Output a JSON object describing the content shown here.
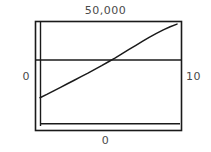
{
  "figure": {
    "title": "50,000",
    "left_label": "0",
    "right_label": "10",
    "bottom_label": "0"
  },
  "colors": {
    "frame": "#1a1a1a",
    "line": "#1a1a1a",
    "reference_line": "#1a1a1a",
    "text": "#4a4a4a",
    "background": "#ffffff"
  },
  "chart_data": {
    "type": "line",
    "title": "50,000",
    "xlabel": "0",
    "ylabel": "",
    "left_axis_label": "0",
    "right_axis_label": "10",
    "bottom_axis_label": "0",
    "grid": false,
    "legend": "none",
    "xlim": [
      0,
      10
    ],
    "ylim": [
      0,
      50000
    ],
    "series": [
      {
        "name": "curve",
        "x": [
          0.0,
          0.5,
          1.0,
          1.5,
          2.0,
          2.5,
          3.0,
          3.5,
          4.0,
          4.5,
          5.0,
          5.5,
          6.0,
          6.5,
          7.0,
          7.5,
          8.0,
          8.5,
          9.0,
          9.5,
          10.0
        ],
        "y": [
          13600,
          15200,
          16900,
          18600,
          20300,
          22000,
          23700,
          25400,
          27200,
          29000,
          30900,
          32800,
          34800,
          36800,
          38800,
          40800,
          42700,
          44500,
          46200,
          47700,
          49000
        ]
      },
      {
        "name": "reference-line",
        "x": [
          0,
          10
        ],
        "y": [
          31700,
          31700
        ]
      },
      {
        "name": "baseline",
        "x": [
          0,
          10
        ],
        "y": [
          1100,
          1100
        ]
      }
    ]
  }
}
